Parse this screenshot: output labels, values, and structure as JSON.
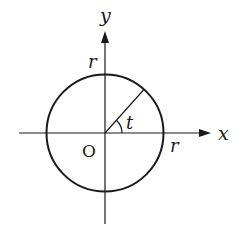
{
  "diagram": {
    "type": "coordinate-circle",
    "labels": {
      "y_axis": "y",
      "x_axis": "x",
      "radius_top": "r",
      "radius_right": "r",
      "angle": "t",
      "origin": "O"
    },
    "colors": {
      "stroke": "#1a1a1a",
      "background": "#ffffff"
    }
  }
}
